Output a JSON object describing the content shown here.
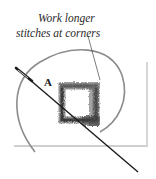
{
  "figure": {
    "annotation": {
      "line1": "Work longer",
      "line2": "stitches at corners"
    },
    "point_label": "A",
    "elements": [
      "fabric-panel",
      "embroidery-hoop-arc",
      "stitched-square-outline",
      "needle",
      "leader-line"
    ],
    "colors": {
      "ink": "#2a2a2a",
      "stitch_dark": "#3a3a3a",
      "stitch_light": "#9a9a9a",
      "hoop": "#8c8c8c",
      "fabric_edge": "#cfcfcf"
    }
  }
}
